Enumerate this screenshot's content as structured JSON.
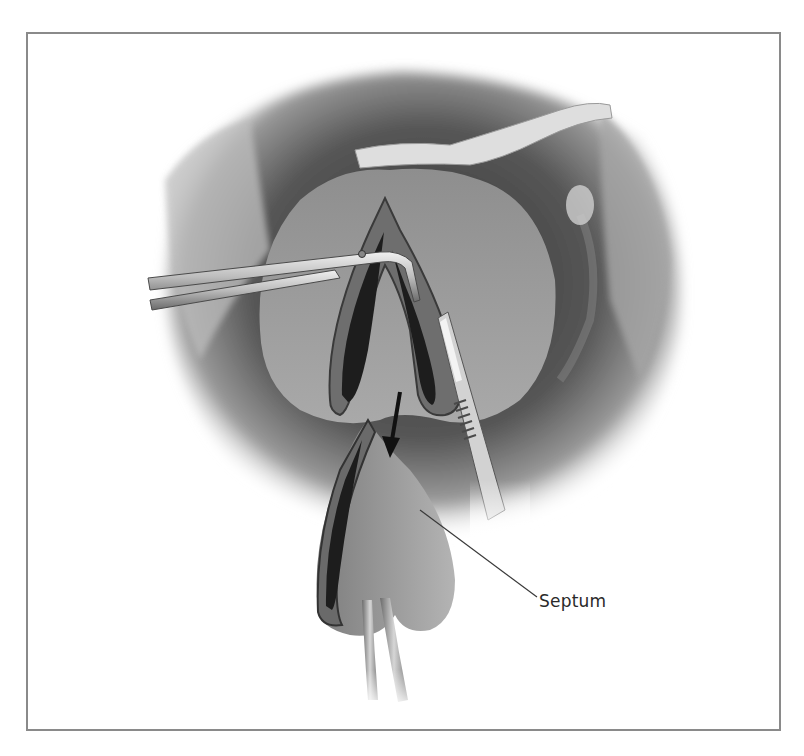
{
  "figure": {
    "labels": [
      {
        "id": "septum",
        "text": "Septum"
      }
    ],
    "arrow": {
      "direction": "down",
      "meaning": "direction of incision"
    },
    "instruments": [
      "forceps-icon",
      "scalpel-icon",
      "drain-tube-icon"
    ],
    "colors": {
      "frame": "#8a8a8a",
      "label_text": "#2a2a2a",
      "leader_line": "#3a3a3a",
      "tissue_dark": "#3c3c3c",
      "tissue_mid": "#8c8c8c",
      "tissue_light": "#c9c9c9"
    }
  }
}
